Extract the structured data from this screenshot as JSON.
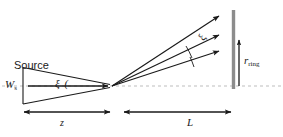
{
  "figure": {
    "type": "optical-ray-diagram",
    "background_color": "#ffffff",
    "line_color": "#1a1a1a",
    "axis_color": "#b9b9b9",
    "ring_color": "#8c8c8c"
  },
  "labels": {
    "source": "Source",
    "source_width_symbol": "W",
    "source_width_subscript": "s",
    "source_angle": "ξ (",
    "ray_angle": "ξ",
    "ring_radius_symbol": "r",
    "ring_radius_subscript": "ring",
    "distance_z": "z",
    "distance_L": "L"
  },
  "geometry": {
    "optical_axis_y": 86,
    "convergence_point": {
      "x": 112,
      "y": 86
    },
    "source_plane_x": 23,
    "source_top_y": 67,
    "source_bottom_y": 104,
    "ring_plane_x": 233,
    "ring_top_y": 10,
    "ring_bottom_y": 89,
    "rays": [
      {
        "end_x": 224,
        "end_y": 13
      },
      {
        "end_x": 224,
        "end_y": 33
      },
      {
        "end_x": 224,
        "end_y": 49
      }
    ],
    "dimension_z": {
      "x1": 23,
      "x2": 112,
      "y": 112
    },
    "dimension_L": {
      "x1": 122,
      "x2": 233,
      "y": 112
    }
  }
}
